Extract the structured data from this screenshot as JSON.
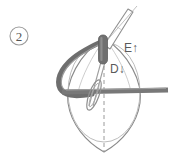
{
  "figure": {
    "type": "line-drawing",
    "background_color": "#ffffff",
    "width": 171,
    "height": 160,
    "step_badge": {
      "label": "2",
      "shape": "circle",
      "cx": 19,
      "cy": 36,
      "r": 9,
      "stroke_color": "#9b9b9b",
      "text_color": "#555555"
    },
    "annotations": [
      {
        "id": "label-e",
        "text": "E↑",
        "letter": "E",
        "arrow": "up",
        "x": 124,
        "y": 52,
        "color": "#5a5a5a"
      },
      {
        "id": "label-d",
        "text": "D↓",
        "letter": "D",
        "arrow": "down",
        "x": 110,
        "y": 73,
        "color": "#5a5a5a"
      }
    ],
    "colors": {
      "outline": "#8a8a8a",
      "dark_instrument": "#6e6e6e",
      "mid_instrument": "#787878",
      "cannula_dark": "#707070",
      "cannula_shadow": "#5e5e5e",
      "dashed_line": "#9a9a9a",
      "thin_line": "#a6a6a6"
    },
    "parts": [
      {
        "id": "leaf-body",
        "name": "oval-leaf-outline",
        "description": "pointed-oval anatomical body outline"
      },
      {
        "id": "equator-ellipse",
        "name": "equator-ellipse",
        "description": "faint ellipse marking the equator of the body"
      },
      {
        "id": "center-dashed",
        "name": "center-axis-dashed",
        "description": "vertical dashed center axis"
      },
      {
        "id": "cannula",
        "name": "cannula-tube",
        "description": "dark vertical tube entering the apex"
      },
      {
        "id": "upper-shaft",
        "name": "instrument-shaft-upper",
        "description": "thin elongated instrument shaft angled up-right"
      },
      {
        "id": "curved-band",
        "name": "curved-retractor-band",
        "description": "thick curved band sweeping from apex left and down"
      },
      {
        "id": "horizontal-band",
        "name": "horizontal-instrument-band",
        "description": "thick horizontal band crossing the body to the right edge"
      },
      {
        "id": "suture-loop",
        "name": "suture-loop",
        "description": "thin elongated loop overlapping the horizontal band"
      },
      {
        "id": "inner-shaft",
        "name": "instrument-shaft-inner",
        "description": "thin shaft running from cannula down through the loop"
      }
    ]
  }
}
